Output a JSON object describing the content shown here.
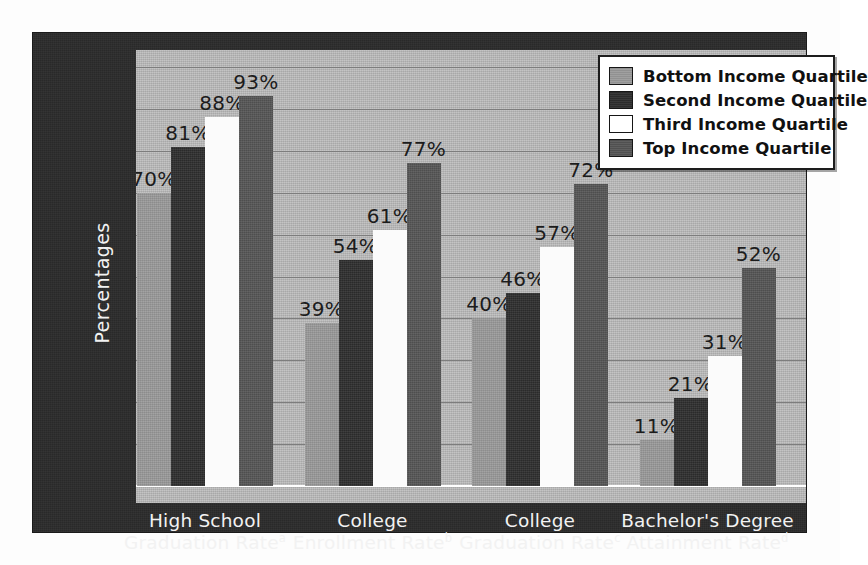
{
  "chart_data": {
    "type": "bar",
    "title": "",
    "xlabel": "",
    "ylabel": "Percentages",
    "ylim": [
      0,
      100
    ],
    "ytick_step": 10,
    "yticks": [
      "100",
      "90",
      "80",
      "70",
      "60",
      "50",
      "40",
      "30",
      "20",
      "10",
      "0"
    ],
    "grid": true,
    "legend_position": "top-right",
    "value_label_suffix": "%",
    "categories": [
      {
        "line1": "High School",
        "line2": "Graduation Rate",
        "note": "a"
      },
      {
        "line1": "College",
        "line2": "Enrollment Rate",
        "note": "b"
      },
      {
        "line1": "College",
        "line2": "Graduation Rate",
        "note": "c"
      },
      {
        "line1": "Bachelor's Degree",
        "line2": "Attainment Rate",
        "note": "d"
      }
    ],
    "series": [
      {
        "name": "Bottom Income Quartile",
        "color": "#9a9a9a",
        "values": [
          70,
          39,
          40,
          11
        ],
        "labels": [
          "70%",
          "39%",
          "40%",
          "11%"
        ]
      },
      {
        "name": "Second Income Quartile",
        "color": "#2e2e2e",
        "values": [
          81,
          54,
          46,
          21
        ],
        "labels": [
          "81%",
          "54%",
          "46%",
          "21%"
        ]
      },
      {
        "name": "Third Income Quartile",
        "color": "#ffffff",
        "values": [
          88,
          61,
          57,
          31
        ],
        "labels": [
          "88%",
          "61%",
          "57%",
          "31%"
        ]
      },
      {
        "name": "Top Income Quartile",
        "color": "#555555",
        "values": [
          93,
          77,
          72,
          52
        ],
        "labels": [
          "93%",
          "77%",
          "72%",
          "52%"
        ]
      }
    ]
  },
  "legend": {
    "items": [
      {
        "label": "Bottom Income Quartile",
        "swatch": "#9a9a9a"
      },
      {
        "label": "Second Income Quartile",
        "swatch": "#2e2e2e"
      },
      {
        "label": "Third Income Quartile",
        "swatch": "#ffffff"
      },
      {
        "label": "Top Income Quartile",
        "swatch": "#555555"
      }
    ]
  },
  "theme": {
    "panel_background": "#2b2b2b",
    "plot_background": "#b9b9b9",
    "gridline_color": "#7d7d7d",
    "axis_text_color": "#f2f2f2",
    "value_label_color": "#1c1c1c"
  }
}
